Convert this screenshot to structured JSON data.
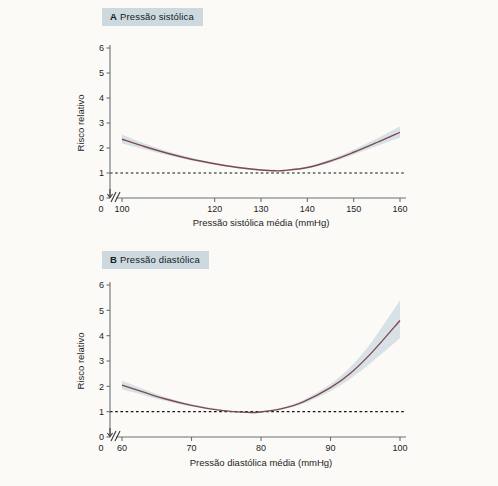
{
  "figure": {
    "background_color": "#fbfaf7",
    "badge_color": "#ccdae0",
    "curve_color": "#7d4a50",
    "band_color": "#b9cbd6"
  },
  "panels": [
    {
      "tag": "A",
      "title": "Pressão sistólica",
      "ylabel": "Risco relativo",
      "xlabel": "Pressão sistólica média (mmHg)",
      "y_ticks": [
        "0",
        "1",
        "2",
        "3",
        "4",
        "5",
        "6"
      ],
      "x_ticks": [
        "0",
        "100",
        "120",
        "130",
        "140",
        "150",
        "160"
      ],
      "reference_value": "1"
    },
    {
      "tag": "B",
      "title": "Pressão diastólica",
      "ylabel": "Risco relativo",
      "xlabel": "Pressão diastólica média (mmHg)",
      "y_ticks": [
        "0",
        "1",
        "2",
        "3",
        "4",
        "5",
        "6"
      ],
      "x_ticks": [
        "0",
        "60",
        "70",
        "80",
        "90",
        "100"
      ],
      "reference_value": "1"
    }
  ],
  "chart_data": [
    {
      "type": "line",
      "panel": "A",
      "title": "A Pressão sistólica",
      "xlabel": "Pressão sistólica média (mmHg)",
      "ylabel": "Risco relativo",
      "xlim": [
        100,
        160
      ],
      "ylim": [
        0,
        6
      ],
      "xticks": [
        100,
        120,
        130,
        140,
        150,
        160
      ],
      "yticks": [
        0,
        1,
        2,
        3,
        4,
        5,
        6
      ],
      "axis_break": true,
      "grid": false,
      "legend": "none",
      "reference_line": {
        "y": 1,
        "style": "dashed"
      },
      "x": [
        100,
        105,
        110,
        115,
        120,
        125,
        130,
        133,
        135,
        140,
        145,
        150,
        155,
        160
      ],
      "series": [
        {
          "name": "Risco relativo",
          "values": [
            2.35,
            2.05,
            1.78,
            1.55,
            1.37,
            1.22,
            1.12,
            1.09,
            1.1,
            1.22,
            1.48,
            1.83,
            2.22,
            2.63
          ]
        },
        {
          "name": "IC 95% inferior",
          "values": [
            2.18,
            1.94,
            1.71,
            1.5,
            1.33,
            1.19,
            1.09,
            1.06,
            1.07,
            1.18,
            1.42,
            1.74,
            2.08,
            2.42
          ]
        },
        {
          "name": "IC 95% superior",
          "values": [
            2.54,
            2.17,
            1.86,
            1.61,
            1.41,
            1.26,
            1.15,
            1.12,
            1.13,
            1.26,
            1.55,
            1.93,
            2.38,
            2.86
          ]
        }
      ]
    },
    {
      "type": "line",
      "panel": "B",
      "title": "B Pressão diastólica",
      "xlabel": "Pressão diastólica média (mmHg)",
      "ylabel": "Risco relativo",
      "xlim": [
        60,
        100
      ],
      "ylim": [
        0,
        6
      ],
      "xticks": [
        60,
        70,
        80,
        90,
        100
      ],
      "yticks": [
        0,
        1,
        2,
        3,
        4,
        5,
        6
      ],
      "axis_break": true,
      "grid": false,
      "legend": "none",
      "reference_line": {
        "y": 1,
        "style": "dashed"
      },
      "x": [
        60,
        63,
        66,
        70,
        74,
        78,
        80,
        83,
        86,
        90,
        93,
        96,
        100
      ],
      "series": [
        {
          "name": "Risco relativo",
          "values": [
            2.05,
            1.78,
            1.52,
            1.25,
            1.06,
            0.97,
            0.99,
            1.12,
            1.38,
            1.95,
            2.55,
            3.35,
            4.6
          ]
        },
        {
          "name": "IC 95% inferior",
          "values": [
            1.88,
            1.66,
            1.44,
            1.2,
            1.03,
            0.95,
            0.96,
            1.08,
            1.31,
            1.82,
            2.33,
            2.97,
            3.9
          ]
        },
        {
          "name": "IC 95% superior",
          "values": [
            2.22,
            1.9,
            1.6,
            1.3,
            1.1,
            1.0,
            1.02,
            1.16,
            1.45,
            2.09,
            2.8,
            3.78,
            5.4
          ]
        }
      ]
    }
  ]
}
